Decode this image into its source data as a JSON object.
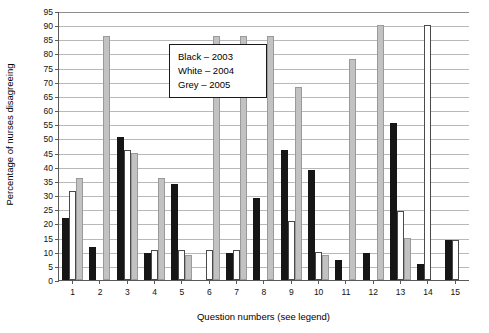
{
  "chart_data": {
    "type": "bar",
    "title": "",
    "xlabel": "Question numbers (see legend)",
    "ylabel": "Percentage of nurses disagreeing",
    "ylim": [
      0,
      95
    ],
    "ytick_step": 5,
    "grid": true,
    "legend_position": "inside-top-left",
    "categories": [
      "1",
      "2",
      "3",
      "4",
      "5",
      "6",
      "7",
      "8",
      "9",
      "10",
      "11",
      "12",
      "13",
      "14",
      "15"
    ],
    "yticks": [
      "0",
      "5",
      "10",
      "15",
      "20",
      "25",
      "30",
      "35",
      "40",
      "45",
      "50",
      "55",
      "60",
      "65",
      "70",
      "75",
      "80",
      "85",
      "90",
      "95"
    ],
    "series": [
      {
        "name": "Black – 2003",
        "color": "#161616",
        "values": [
          22,
          11.5,
          50.5,
          9.5,
          34,
          0,
          9.5,
          29,
          46,
          39,
          7,
          9.5,
          55.5,
          5.5,
          14
        ]
      },
      {
        "name": "White – 2004",
        "color": "#ffffff",
        "values": [
          31.5,
          0,
          46,
          10.5,
          10.5,
          10.5,
          10.5,
          0,
          21,
          10,
          0,
          0,
          24.5,
          90,
          14
        ]
      },
      {
        "name": "Grey – 2005",
        "color": "#c2c2c2",
        "values": [
          36,
          86,
          45,
          36,
          9,
          86,
          86,
          86,
          68,
          9,
          78,
          90,
          15,
          0,
          0
        ]
      }
    ]
  },
  "legend": {
    "items": [
      {
        "label": "Black – 2003"
      },
      {
        "label": "White – 2004"
      },
      {
        "label": "Grey – 2005"
      }
    ]
  }
}
